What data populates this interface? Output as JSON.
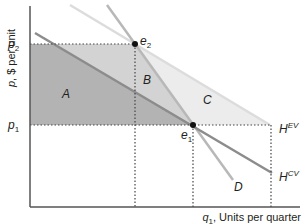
{
  "axes": {
    "y_label_var": "p",
    "y_label_rest": ", $ per unit",
    "x_label_var": "q",
    "x_label_sub": "1",
    "x_label_rest": ", Units per quarter"
  },
  "ticks": {
    "p2": {
      "var": "p",
      "sub": "2"
    },
    "p1": {
      "var": "p",
      "sub": "1"
    }
  },
  "points": {
    "e2": {
      "var": "e",
      "sub": "2"
    },
    "e1": {
      "var": "e",
      "sub": "1"
    }
  },
  "regions": {
    "A": "A",
    "B": "B",
    "C": "C"
  },
  "curves": {
    "D": "D",
    "HEV": {
      "base": "H",
      "sup": "EV"
    },
    "HCV": {
      "base": "H",
      "sup": "CV"
    }
  },
  "colors": {
    "region_A": "#b3b3b3",
    "region_B": "#d3d3d3",
    "region_C": "#ececec",
    "hcv_line": "#8c8c8c",
    "d_line": "#b8b8b8",
    "hev_line": "#dcdcdc",
    "axis": "#555555"
  }
}
